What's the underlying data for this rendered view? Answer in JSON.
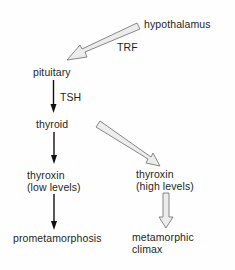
{
  "diagram": {
    "nodes": {
      "hypothalamus": "hypothalamus",
      "pituitary": "pituitary",
      "thyroid": "thyroid",
      "thyroxin_low_line1": "thyroxin",
      "thyroxin_low_line2": "(low levels)",
      "thyroxin_high_line1": "thyroxin",
      "thyroxin_high_line2": "(high levels)",
      "prometamorphosis": "prometamorphosis",
      "metamorphic_climax_line1": "metamorphic",
      "metamorphic_climax_line2": "climax"
    },
    "edge_labels": {
      "trf": "TRF",
      "tsh": "TSH"
    },
    "edges": [
      {
        "from": "hypothalamus",
        "to": "pituitary",
        "label": "TRF",
        "style": "hollow-block-arrow"
      },
      {
        "from": "pituitary",
        "to": "thyroid",
        "label": "TSH",
        "style": "solid-line-arrow"
      },
      {
        "from": "thyroid",
        "to": "thyroxin (low levels)",
        "style": "solid-line-arrow"
      },
      {
        "from": "thyroid",
        "to": "thyroxin (high levels)",
        "style": "hollow-block-arrow"
      },
      {
        "from": "thyroxin (low levels)",
        "to": "prometamorphosis",
        "style": "solid-line-arrow"
      },
      {
        "from": "thyroxin (high levels)",
        "to": "metamorphic climax",
        "style": "hollow-block-arrow"
      }
    ],
    "colors": {
      "text": "#1e1e1e",
      "line": "#111111",
      "block_fill": "#ececec",
      "block_stroke": "#7a7a7a"
    }
  }
}
